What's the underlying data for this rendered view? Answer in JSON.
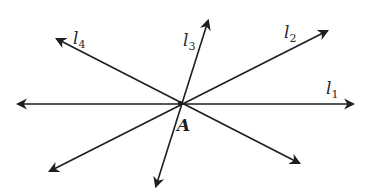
{
  "diagram": {
    "title": "",
    "point": {
      "name": "A",
      "x": 180,
      "y": 103,
      "label_x": 177,
      "label_y": 131
    },
    "lines": [
      {
        "id": "l1",
        "label_main": "l",
        "label_sub": "1",
        "from": [
          18,
          104
        ],
        "to": [
          353,
          104
        ],
        "arrows": "both",
        "label_x": 326,
        "label_y": 94
      },
      {
        "id": "l2",
        "label_main": "l",
        "label_sub": "2",
        "from": [
          50,
          171
        ],
        "to": [
          327,
          31
        ],
        "arrows": "both",
        "label_x": 284,
        "label_y": 38
      },
      {
        "id": "l3",
        "label_main": "l",
        "label_sub": "3",
        "from": [
          156,
          186
        ],
        "to": [
          208,
          21
        ],
        "arrows": "both",
        "label_x": 183,
        "label_y": 46
      },
      {
        "id": "l4",
        "label_main": "l",
        "label_sub": "4",
        "from": [
          299,
          163
        ],
        "to": [
          57,
          39
        ],
        "arrows": "both",
        "label_x": 73,
        "label_y": 44
      }
    ],
    "colors": {
      "stroke": "#1e1e1e",
      "background": "#ffffff"
    }
  }
}
